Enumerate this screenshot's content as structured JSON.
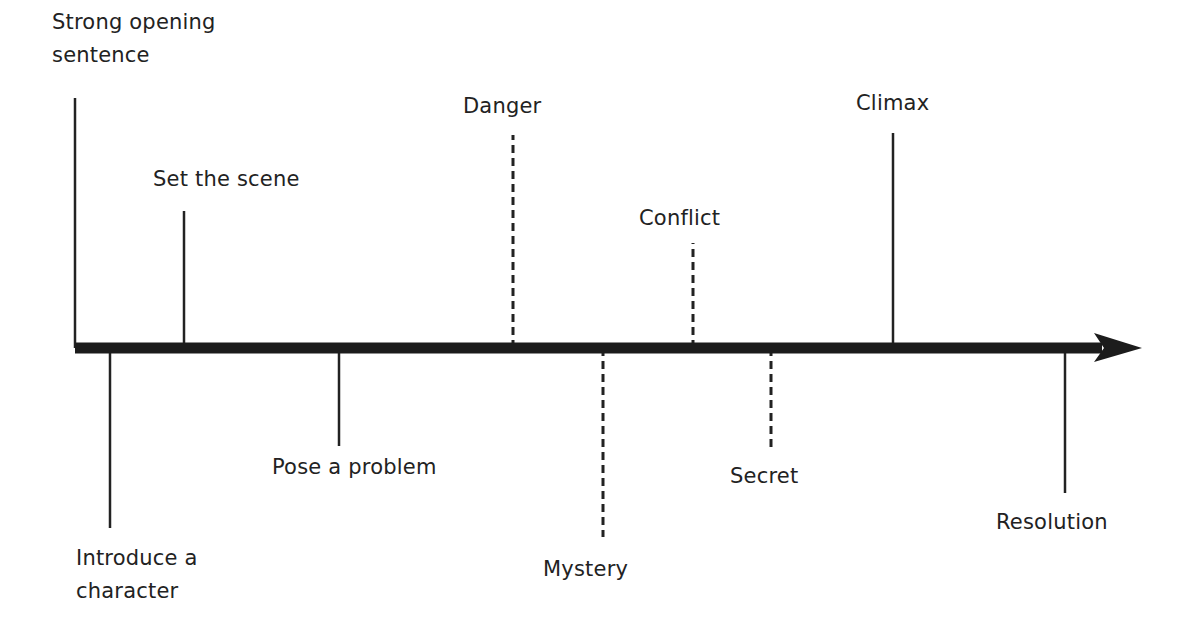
{
  "diagram": {
    "type": "story-timeline",
    "axis": {
      "x_start": 75,
      "x_end": 1142,
      "y": 348,
      "color": "#1c1c1c",
      "thickness": 11
    },
    "events": [
      {
        "id": "strong-opening-sentence",
        "label": "Strong opening\nsentence",
        "side": "above",
        "style": "solid",
        "x": 75,
        "line_end_y": 98,
        "label_x": 52,
        "label_y": 6
      },
      {
        "id": "introduce-a-character",
        "label": "Introduce a\ncharacter",
        "side": "below",
        "style": "solid",
        "x": 110,
        "line_end_y": 528,
        "label_x": 76,
        "label_y": 542
      },
      {
        "id": "set-the-scene",
        "label": "Set the scene",
        "side": "above",
        "style": "solid",
        "x": 184,
        "line_end_y": 211,
        "label_x": 153,
        "label_y": 163
      },
      {
        "id": "pose-a-problem",
        "label": "Pose a problem",
        "side": "below",
        "style": "solid",
        "x": 339,
        "line_end_y": 446,
        "label_x": 272,
        "label_y": 451
      },
      {
        "id": "danger",
        "label": "Danger",
        "side": "above",
        "style": "dashed",
        "x": 513,
        "line_end_y": 135,
        "label_x": 463,
        "label_y": 90
      },
      {
        "id": "mystery",
        "label": "Mystery",
        "side": "below",
        "style": "dashed",
        "x": 603,
        "line_end_y": 537,
        "label_x": 543,
        "label_y": 553
      },
      {
        "id": "conflict",
        "label": "Conflict",
        "side": "above",
        "style": "dashed",
        "x": 693,
        "line_end_y": 243,
        "label_x": 639,
        "label_y": 202
      },
      {
        "id": "secret",
        "label": "Secret",
        "side": "below",
        "style": "dashed",
        "x": 771,
        "line_end_y": 450,
        "label_x": 730,
        "label_y": 460
      },
      {
        "id": "climax",
        "label": "Climax",
        "side": "above",
        "style": "solid",
        "x": 893,
        "line_end_y": 133,
        "label_x": 856,
        "label_y": 87
      },
      {
        "id": "resolution",
        "label": "Resolution",
        "side": "below",
        "style": "solid",
        "x": 1065,
        "line_end_y": 493,
        "label_x": 996,
        "label_y": 506
      }
    ]
  }
}
